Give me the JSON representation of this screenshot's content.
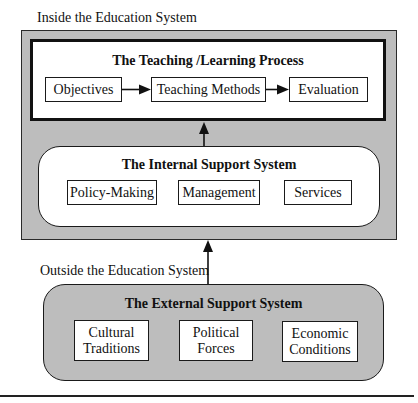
{
  "labels": {
    "inside": "Inside the Education System",
    "outside": "Outside the Education System"
  },
  "teaching": {
    "title": "The Teaching /Learning Process",
    "items": [
      "Objectives",
      "Teaching Methods",
      "Evaluation"
    ]
  },
  "internal": {
    "title": "The Internal Support System",
    "items": [
      "Policy-Making",
      "Management",
      "Services"
    ]
  },
  "external": {
    "title": "The External Support System",
    "items": [
      {
        "line1": "Cultural",
        "line2": "Traditions"
      },
      {
        "line1": "Political",
        "line2": "Forces"
      },
      {
        "line1": "Economic",
        "line2": "Conditions"
      }
    ]
  },
  "colors": {
    "region_fill": "#bdbdbd",
    "box_fill": "#ffffff",
    "stroke": "#111111"
  }
}
